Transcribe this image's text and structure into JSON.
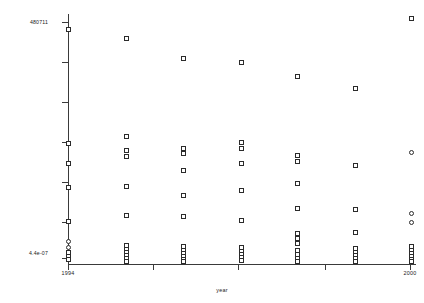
{
  "axes": {
    "y_label_top": "480711",
    "y_label_bottom": "4.4e-07",
    "x_label_left": "1994",
    "x_label_right": "2000",
    "x_axis_title": "year"
  },
  "chart_data": {
    "type": "scatter",
    "title": "",
    "xlabel": "year",
    "ylabel": "",
    "grid": false,
    "legend": "none",
    "marker": "open-square",
    "y_scale": "log",
    "ylim": [
      4.4e-07,
      480711
    ],
    "xlim": [
      1993.6,
      2000.6
    ],
    "xticks": [
      1994,
      1995.7,
      1997.4,
      1999.1,
      2000.8
    ],
    "xtick_labels": [
      "1994",
      "",
      "",
      "",
      "2000"
    ],
    "ytick_labels": [
      "480711",
      "",
      "",
      "",
      "",
      "4.4e-07"
    ],
    "categories": [
      1994,
      1995,
      1996,
      1997,
      1998,
      1999,
      2000
    ],
    "points": [
      {
        "x": 1994,
        "px": 68,
        "py": 29,
        "shape": "sq"
      },
      {
        "x": 1994,
        "px": 68,
        "py": 143,
        "shape": "sq"
      },
      {
        "x": 1994,
        "px": 68,
        "py": 163,
        "shape": "sq"
      },
      {
        "x": 1994,
        "px": 68,
        "py": 187,
        "shape": "sq"
      },
      {
        "x": 1994,
        "px": 68,
        "py": 221,
        "shape": "sq"
      },
      {
        "x": 1994,
        "px": 68,
        "py": 241,
        "shape": "ci"
      },
      {
        "x": 1994,
        "px": 68,
        "py": 247,
        "shape": "ci"
      },
      {
        "x": 1994,
        "px": 68,
        "py": 252,
        "shape": "sq"
      },
      {
        "x": 1994,
        "px": 68,
        "py": 256,
        "shape": "sq"
      },
      {
        "x": 1994,
        "px": 68,
        "py": 259,
        "shape": "sq"
      },
      {
        "x": 1995,
        "px": 126,
        "py": 38,
        "shape": "sq"
      },
      {
        "x": 1995,
        "px": 126,
        "py": 136,
        "shape": "sq"
      },
      {
        "x": 1995,
        "px": 126,
        "py": 150,
        "shape": "sq"
      },
      {
        "x": 1995,
        "px": 126,
        "py": 156,
        "shape": "sq"
      },
      {
        "x": 1995,
        "px": 126,
        "py": 186,
        "shape": "sq"
      },
      {
        "x": 1995,
        "px": 126,
        "py": 215,
        "shape": "sq"
      },
      {
        "x": 1995,
        "px": 126,
        "py": 245,
        "shape": "sq"
      },
      {
        "x": 1995,
        "px": 126,
        "py": 249,
        "shape": "sq"
      },
      {
        "x": 1995,
        "px": 126,
        "py": 252,
        "shape": "sq"
      },
      {
        "x": 1995,
        "px": 126,
        "py": 255,
        "shape": "sq"
      },
      {
        "x": 1995,
        "px": 126,
        "py": 258,
        "shape": "sq"
      },
      {
        "x": 1995,
        "px": 126,
        "py": 261,
        "shape": "sq"
      },
      {
        "x": 1996,
        "px": 183,
        "py": 58,
        "shape": "sq"
      },
      {
        "x": 1996,
        "px": 183,
        "py": 148,
        "shape": "sq"
      },
      {
        "x": 1996,
        "px": 183,
        "py": 153,
        "shape": "sq"
      },
      {
        "x": 1996,
        "px": 183,
        "py": 170,
        "shape": "sq"
      },
      {
        "x": 1996,
        "px": 183,
        "py": 195,
        "shape": "sq"
      },
      {
        "x": 1996,
        "px": 183,
        "py": 216,
        "shape": "sq"
      },
      {
        "x": 1996,
        "px": 183,
        "py": 246,
        "shape": "sq"
      },
      {
        "x": 1996,
        "px": 183,
        "py": 250,
        "shape": "sq"
      },
      {
        "x": 1996,
        "px": 183,
        "py": 253,
        "shape": "sq"
      },
      {
        "x": 1996,
        "px": 183,
        "py": 256,
        "shape": "sq"
      },
      {
        "x": 1996,
        "px": 183,
        "py": 259,
        "shape": "sq"
      },
      {
        "x": 1996,
        "px": 183,
        "py": 261,
        "shape": "sq"
      },
      {
        "x": 1997,
        "px": 241,
        "py": 62,
        "shape": "sq"
      },
      {
        "x": 1997,
        "px": 241,
        "py": 142,
        "shape": "sq"
      },
      {
        "x": 1997,
        "px": 241,
        "py": 148,
        "shape": "sq"
      },
      {
        "x": 1997,
        "px": 241,
        "py": 163,
        "shape": "sq"
      },
      {
        "x": 1997,
        "px": 241,
        "py": 190,
        "shape": "sq"
      },
      {
        "x": 1997,
        "px": 241,
        "py": 220,
        "shape": "sq"
      },
      {
        "x": 1997,
        "px": 241,
        "py": 247,
        "shape": "sq"
      },
      {
        "x": 1997,
        "px": 241,
        "py": 251,
        "shape": "sq"
      },
      {
        "x": 1997,
        "px": 241,
        "py": 254,
        "shape": "sq"
      },
      {
        "x": 1997,
        "px": 241,
        "py": 257,
        "shape": "sq"
      },
      {
        "x": 1997,
        "px": 241,
        "py": 260,
        "shape": "sq"
      },
      {
        "x": 1998,
        "px": 297,
        "py": 76,
        "shape": "sq"
      },
      {
        "x": 1998,
        "px": 297,
        "py": 155,
        "shape": "sq"
      },
      {
        "x": 1998,
        "px": 297,
        "py": 161,
        "shape": "sq"
      },
      {
        "x": 1998,
        "px": 297,
        "py": 183,
        "shape": "sq"
      },
      {
        "x": 1998,
        "px": 297,
        "py": 208,
        "shape": "sq"
      },
      {
        "x": 1998,
        "px": 297,
        "py": 233,
        "shape": "sq"
      },
      {
        "x": 1998,
        "px": 297,
        "py": 238,
        "shape": "sq"
      },
      {
        "x": 1998,
        "px": 297,
        "py": 243,
        "shape": "sq"
      },
      {
        "x": 1998,
        "px": 297,
        "py": 250,
        "shape": "sq"
      },
      {
        "x": 1998,
        "px": 297,
        "py": 254,
        "shape": "sq"
      },
      {
        "x": 1998,
        "px": 297,
        "py": 258,
        "shape": "sq"
      },
      {
        "x": 1998,
        "px": 297,
        "py": 261,
        "shape": "sq"
      },
      {
        "x": 1999,
        "px": 355,
        "py": 88,
        "shape": "sq"
      },
      {
        "x": 1999,
        "px": 355,
        "py": 165,
        "shape": "sq"
      },
      {
        "x": 1999,
        "px": 355,
        "py": 209,
        "shape": "sq"
      },
      {
        "x": 1999,
        "px": 355,
        "py": 232,
        "shape": "sq"
      },
      {
        "x": 1999,
        "px": 355,
        "py": 248,
        "shape": "sq"
      },
      {
        "x": 1999,
        "px": 355,
        "py": 252,
        "shape": "sq"
      },
      {
        "x": 1999,
        "px": 355,
        "py": 255,
        "shape": "sq"
      },
      {
        "x": 1999,
        "px": 355,
        "py": 258,
        "shape": "sq"
      },
      {
        "x": 1999,
        "px": 355,
        "py": 261,
        "shape": "sq"
      },
      {
        "x": 2000,
        "px": 411,
        "py": 18,
        "shape": "sq"
      },
      {
        "x": 2000,
        "px": 411,
        "py": 152,
        "shape": "ci"
      },
      {
        "x": 2000,
        "px": 411,
        "py": 213,
        "shape": "ci"
      },
      {
        "x": 2000,
        "px": 411,
        "py": 222,
        "shape": "ci"
      },
      {
        "x": 2000,
        "px": 411,
        "py": 246,
        "shape": "sq"
      },
      {
        "x": 2000,
        "px": 411,
        "py": 250,
        "shape": "sq"
      },
      {
        "x": 2000,
        "px": 411,
        "py": 253,
        "shape": "sq"
      },
      {
        "x": 2000,
        "px": 411,
        "py": 256,
        "shape": "sq"
      },
      {
        "x": 2000,
        "px": 411,
        "py": 259,
        "shape": "sq"
      },
      {
        "x": 2000,
        "px": 411,
        "py": 261,
        "shape": "sq"
      }
    ],
    "yticks_px": [
      22,
      62,
      102,
      142,
      182,
      222,
      258
    ],
    "xticks_px": [
      68,
      153,
      238,
      325,
      410
    ]
  }
}
